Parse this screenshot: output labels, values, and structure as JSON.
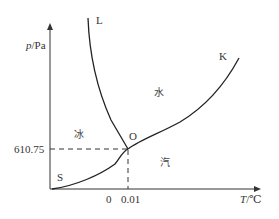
{
  "axes": {
    "y_label_var": "p",
    "y_label_unit": "/Pa",
    "x_label_var": "T",
    "x_label_unit": "/℃"
  },
  "curves": {
    "L": "L",
    "K": "K",
    "S": "S"
  },
  "triple_point": {
    "label": "O",
    "pressure": "610.75",
    "temp_0": "0",
    "temp_triple": "0.01"
  },
  "regions": {
    "liquid": "水",
    "solid": "冰",
    "vapor": "汽"
  },
  "colors": {
    "line": "#333333",
    "background": "#ffffff"
  }
}
